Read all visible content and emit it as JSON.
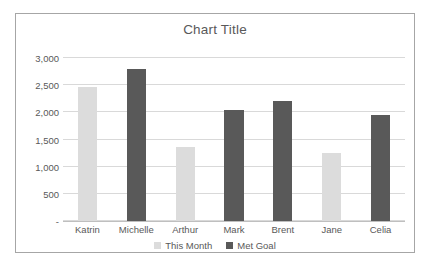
{
  "chart_data": {
    "type": "bar",
    "title": "Chart Title",
    "xlabel": "",
    "ylabel": "",
    "categories": [
      "Katrin",
      "Michelle",
      "Arthur",
      "Mark",
      "Brent",
      "Jane",
      "Celia"
    ],
    "values": [
      2470,
      2800,
      1370,
      2040,
      2210,
      1260,
      1960
    ],
    "point_series": [
      "This Month",
      "Met Goal",
      "This Month",
      "Met Goal",
      "Met Goal",
      "This Month",
      "Met Goal"
    ],
    "series": [
      {
        "name": "This Month",
        "color": "#dcdcdc",
        "points": [
          {
            "category": "Katrin",
            "value": 2470
          },
          {
            "category": "Arthur",
            "value": 1370
          },
          {
            "category": "Jane",
            "value": 1260
          }
        ]
      },
      {
        "name": "Met Goal",
        "color": "#595959",
        "points": [
          {
            "category": "Michelle",
            "value": 2800
          },
          {
            "category": "Mark",
            "value": 2040
          },
          {
            "category": "Brent",
            "value": 2210
          },
          {
            "category": "Celia",
            "value": 1960
          }
        ]
      }
    ],
    "ylim": [
      0,
      3000
    ],
    "yticks": [
      0,
      500,
      1000,
      1500,
      2000,
      2500,
      3000
    ],
    "ytick_labels": [
      "-",
      "500",
      "1,000",
      "1,500",
      "2,000",
      "2,500",
      "3,000"
    ],
    "grid": true,
    "legend_position": "bottom",
    "legend": [
      {
        "label": "This Month",
        "color": "#dcdcdc"
      },
      {
        "label": "Met Goal",
        "color": "#595959"
      }
    ],
    "colors": {
      "this_month": "#dcdcdc",
      "met_goal": "#595959",
      "gridline": "#d9d9d9",
      "axis_text": "#595959",
      "border": "#a6a6a6",
      "plot_background": "#ffffff"
    }
  }
}
